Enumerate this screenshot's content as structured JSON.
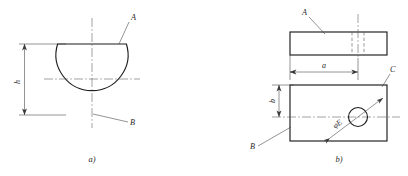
{
  "figure": {
    "background_color": "#ffffff",
    "line_color": "#1c1c1c",
    "thin_line_color": "#3a3a3a",
    "center_line_color": "#555555",
    "hidden_line_color": "#6a6a6a",
    "subfigures": [
      {
        "caption": "a)",
        "description": "front view of a circle with flat chord cut at top",
        "labels": [
          {
            "name": "label-a-flat-face",
            "text": "A"
          },
          {
            "name": "label-b-arc-surface",
            "text": "B"
          }
        ],
        "dimensions": [
          {
            "name": "dimension-h",
            "text": "h",
            "orientation": "vertical"
          }
        ]
      },
      {
        "caption": "b)",
        "description": "two-view drawing: top view rectangle with hidden hole lines, front view rectangle with through hole",
        "labels": [
          {
            "name": "label-a-top-view",
            "text": "A"
          },
          {
            "name": "label-b-front-view",
            "text": "B"
          },
          {
            "name": "label-c-top-edge",
            "text": "C"
          },
          {
            "name": "label-hole-diameter",
            "text": "φE"
          }
        ],
        "dimensions": [
          {
            "name": "dimension-a",
            "text": "a",
            "orientation": "horizontal"
          },
          {
            "name": "dimension-b",
            "text": "b",
            "orientation": "vertical"
          }
        ]
      }
    ]
  },
  "captions": {
    "left": "a)",
    "right": "b)"
  },
  "left_figure": {
    "label_a": "A",
    "label_b": "B",
    "dim_h": "h"
  },
  "right_figure": {
    "label_a": "A",
    "label_b": "B",
    "label_c": "C",
    "label_hole": "φE",
    "dim_a": "a",
    "dim_b": "b"
  }
}
